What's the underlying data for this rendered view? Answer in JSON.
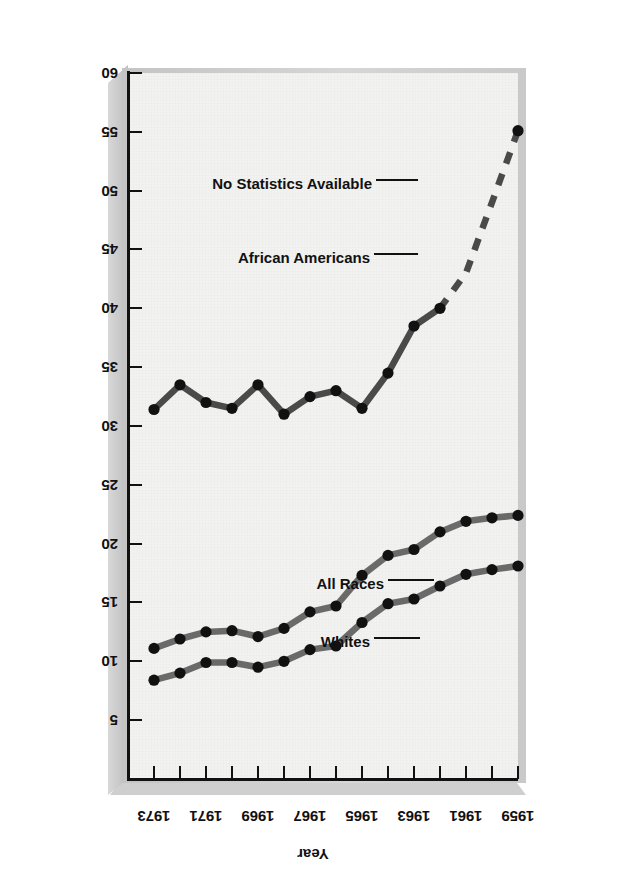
{
  "figure": {
    "orientation": "rotated-180",
    "x_axis_title": "Year",
    "y_axis_title": "Percentage of Population Living Below Poverty Level"
  },
  "annotations": {
    "whites": "Whites",
    "all_races": "All Races",
    "african_americans": "African Americans",
    "no_statistics": "No Statistics Available"
  },
  "colors": {
    "panel": "#f2f2f0",
    "slab": "#cfcfcf",
    "axis": "#111111",
    "line_light": "#6a6a6a",
    "line_dark": "#4a4a4a",
    "marker": "#111111"
  },
  "chart_data": {
    "type": "line",
    "title": "",
    "xlabel": "Year",
    "ylabel": "Percentage of Population Living Below Poverty Level",
    "xlim": [
      1959,
      1974
    ],
    "ylim": [
      0,
      60
    ],
    "y_inverted": true,
    "grid": false,
    "legend": "inline-annotations",
    "x": [
      1959,
      1960,
      1961,
      1962,
      1963,
      1964,
      1965,
      1966,
      1967,
      1968,
      1969,
      1970,
      1971,
      1972,
      1973
    ],
    "xticks": [
      1959,
      1960,
      1961,
      1962,
      1963,
      1964,
      1965,
      1966,
      1967,
      1968,
      1969,
      1970,
      1971,
      1972,
      1973,
      1974
    ],
    "xticklabels": [
      "1959",
      "",
      "1961",
      "",
      "1963",
      "",
      "1965",
      "",
      "1967",
      "",
      "1969",
      "",
      "1971",
      "",
      "1973",
      ""
    ],
    "yticks": [
      5,
      10,
      15,
      20,
      25,
      30,
      35,
      40,
      45,
      50,
      55,
      60
    ],
    "yticklabels": [
      "5",
      "10",
      "15",
      "20",
      "25",
      "30",
      "35",
      "40",
      "45",
      "50",
      "55",
      "60"
    ],
    "series": [
      {
        "name": "All Races",
        "color": "#6a6a6a",
        "style": "solid",
        "values": [
          22.4,
          22.2,
          21.9,
          21.0,
          19.5,
          19.0,
          17.3,
          14.7,
          14.2,
          12.8,
          12.1,
          12.6,
          12.5,
          11.9,
          11.1
        ]
      },
      {
        "name": "Whites",
        "color": "#6a6a6a",
        "style": "solid",
        "values": [
          18.1,
          17.8,
          17.4,
          16.4,
          15.3,
          14.9,
          13.3,
          11.3,
          11.0,
          10.0,
          9.5,
          9.9,
          9.9,
          9.0,
          8.4
        ]
      },
      {
        "name": "African Americans",
        "color": "#4a4a4a",
        "style": "solid-with-dashed-head",
        "dashed_from_index": 0,
        "dashed_to_index": 3,
        "dashed_note": "No Statistics Available",
        "values": [
          55.1,
          49.0,
          43.0,
          40.0,
          38.5,
          34.5,
          31.5,
          33.0,
          32.5,
          31.0,
          33.5,
          31.5,
          32.0,
          33.5,
          31.4
        ]
      }
    ]
  }
}
